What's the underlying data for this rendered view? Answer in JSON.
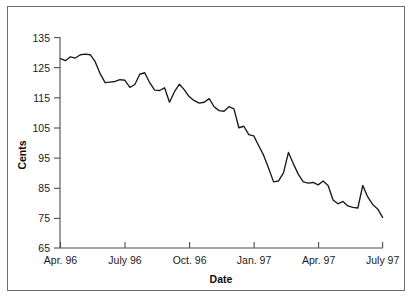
{
  "chart_data": {
    "type": "line",
    "title": "",
    "subtitle": "",
    "xlabel": "Date",
    "ylabel": "Cents",
    "ylim": [
      65,
      135
    ],
    "yticks": [
      65,
      75,
      85,
      95,
      105,
      115,
      125,
      135
    ],
    "ytick_labels": [
      "65",
      "75",
      "85",
      "95",
      "105",
      "115",
      "125",
      "135"
    ],
    "xtick_labels": [
      "Apr. 96",
      "July 96",
      "Oct. 96",
      "Jan. 97",
      "Apr. 97",
      "July 97"
    ],
    "xtick_positions": [
      0,
      13,
      26,
      39,
      52,
      65
    ],
    "grid": false,
    "legend": null,
    "series": [
      {
        "name": "Price",
        "color": "#1a1a1a",
        "x": [
          0,
          1,
          2,
          3,
          4,
          5,
          6,
          7,
          8,
          9,
          10,
          11,
          12,
          13,
          14,
          15,
          16,
          17,
          18,
          19,
          20,
          21,
          22,
          23,
          24,
          25,
          26,
          27,
          28,
          29,
          30,
          31,
          32,
          33,
          34,
          35,
          36,
          37,
          38,
          39,
          40,
          41,
          42,
          43,
          44,
          45,
          46,
          47,
          48,
          49,
          50,
          51,
          52,
          53,
          54,
          55,
          56,
          57,
          58,
          59,
          60,
          61,
          62,
          63,
          64,
          65
        ],
        "values": [
          128.0,
          127.3,
          128.6,
          128.2,
          129.3,
          129.5,
          129.3,
          127.0,
          123.0,
          120.0,
          120.2,
          120.4,
          121.0,
          120.8,
          118.4,
          119.4,
          122.8,
          123.3,
          120.0,
          117.5,
          117.4,
          118.3,
          113.5,
          117.0,
          119.5,
          117.6,
          115.3,
          114.0,
          113.2,
          113.5,
          114.7,
          112.0,
          110.7,
          110.5,
          112.0,
          111.3,
          105.0,
          105.5,
          102.7,
          102.3,
          99.0,
          95.8,
          91.5,
          87.0,
          87.3,
          90.0,
          96.8,
          93.0,
          89.5,
          87.0,
          86.6,
          86.8,
          86.0,
          87.3,
          85.8,
          81.0,
          79.7,
          80.5,
          79.0,
          78.5,
          78.3,
          85.8,
          82.0,
          79.5,
          78.0,
          75.2
        ]
      }
    ]
  },
  "axis": {
    "x_title": "Date",
    "y_title": "Cents"
  }
}
